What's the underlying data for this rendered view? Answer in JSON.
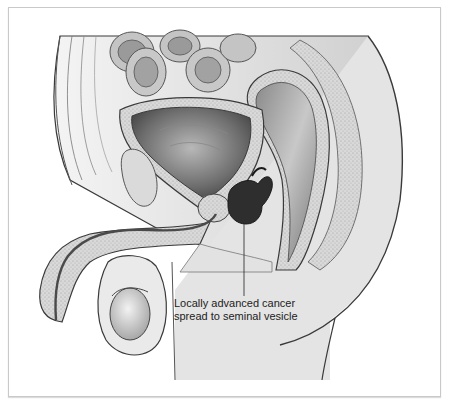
{
  "figure": {
    "annotation": {
      "line1": "Locally advanced cancer",
      "line2": "spread to seminal vesicle"
    },
    "colors": {
      "frame_border": "#c9c9c9",
      "tumor": "#2e2e2e",
      "outline": "#3a3a3a",
      "tissue_light": "#e6e6e6",
      "tissue_mid": "#b5b5b5",
      "tissue_dark": "#7a7a7a",
      "label_text": "#222222"
    }
  }
}
